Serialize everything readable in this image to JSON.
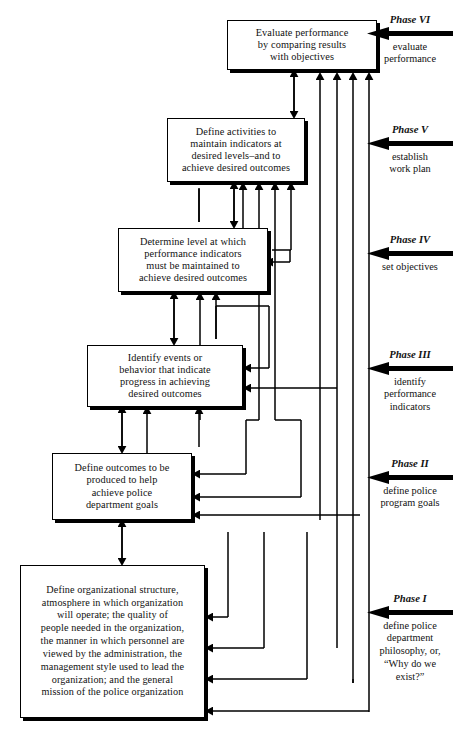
{
  "diagram": {
    "orientation": "bottom-up cascade with feedback arrows",
    "ink_color": "#000000",
    "background_color": "#ffffff"
  },
  "nodes": [
    {
      "id": "node-6",
      "phase_number": "VI",
      "text": "Evaluate performance by comparing results with objectives",
      "lines": [
        "Evaluate performance",
        "by comparing results",
        "with objectives"
      ]
    },
    {
      "id": "node-5",
      "phase_number": "V",
      "text": "Define activities to maintain indicators at desired levels–and to achieve desired outcomes",
      "lines": [
        "Define activities to",
        "maintain indicators at",
        "desired levels–and to",
        "achieve desired outcomes"
      ]
    },
    {
      "id": "node-4",
      "phase_number": "IV",
      "text": "Determine level at which performance indicators must be maintained to achieve desired outcomes",
      "lines": [
        "Determine level at which",
        "performance indicators",
        "must be maintained to",
        "achieve desired outcomes"
      ]
    },
    {
      "id": "node-3",
      "phase_number": "III",
      "text": "Identify events or behavior that indicate progress in achieving desired outcomes",
      "lines": [
        "Identify events or",
        "behavior that indicate",
        "progress in achieving",
        "desired outcomes"
      ]
    },
    {
      "id": "node-2",
      "phase_number": "II",
      "text": "Define outcomes to be produced to help achieve police department goals",
      "lines": [
        "Define outcomes to be",
        "produced to help",
        "achieve police",
        "department goals"
      ]
    },
    {
      "id": "node-1",
      "phase_number": "I",
      "text": "Define organizational structure, atmosphere in which organization will operate; the quality of people needed in the organization, the manner in which personnel are viewed by the administration, the management style used to lead the organization; and the general mission of the police organization",
      "lines": [
        "Define organizational structure,",
        "atmosphere in which organization",
        "will operate; the quality of",
        "people needed in the organization,",
        "the manner in which personnel are",
        "viewed by the administration, the",
        "management style used to lead the",
        "organization; and the general",
        "mission of the police organization"
      ]
    }
  ],
  "phases": [
    {
      "id": "phase-6",
      "title": "Phase VI",
      "arrow_icon": "left-arrow-icon",
      "subtitle_lines": [
        "evaluate",
        "performance"
      ],
      "subtitle": "evaluate performance"
    },
    {
      "id": "phase-5",
      "title": "Phase V",
      "arrow_icon": "left-arrow-icon",
      "subtitle_lines": [
        "establish",
        "work plan"
      ],
      "subtitle": "establish work plan"
    },
    {
      "id": "phase-4",
      "title": "Phase IV",
      "arrow_icon": "left-arrow-icon",
      "subtitle_lines": [
        "set objectives"
      ],
      "subtitle": "set objectives"
    },
    {
      "id": "phase-3",
      "title": "Phase III",
      "arrow_icon": "left-arrow-icon",
      "subtitle_lines": [
        "identify",
        "performance",
        "indicators"
      ],
      "subtitle": "identify performance indicators"
    },
    {
      "id": "phase-2",
      "title": "Phase II",
      "arrow_icon": "left-arrow-icon",
      "subtitle_lines": [
        "define police",
        "program goals"
      ],
      "subtitle": "define police program goals"
    },
    {
      "id": "phase-1",
      "title": "Phase I",
      "arrow_icon": "left-arrow-icon",
      "subtitle_lines": [
        "define police",
        "department",
        "philosophy, or,",
        "“Why do we",
        "exist?”"
      ],
      "subtitle": "define police department philosophy, or, “Why do we exist?”"
    }
  ],
  "connectors": {
    "vertical_chain_label": "double-headed vertical links between consecutive phase boxes",
    "feedback_label": "upward feedback lines from lower phases into every higher phase box"
  }
}
